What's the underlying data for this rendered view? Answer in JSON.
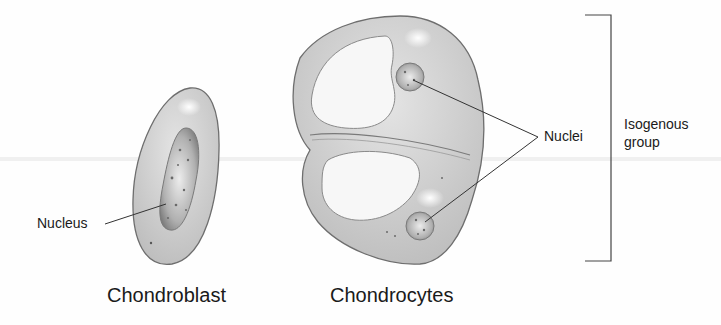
{
  "diagram": {
    "cells": [
      {
        "id": "chondroblast",
        "caption": "Chondroblast",
        "label": "Nucleus"
      },
      {
        "id": "chondrocytes",
        "caption": "Chondrocytes",
        "label": "Nuclei"
      }
    ],
    "bracket_label_line1": "Isogenous",
    "bracket_label_line2": "group",
    "colors": {
      "cytoplasm": "#c9c9c9",
      "cell_outline": "#6e6e6e",
      "lacuna": "#f7f7f7",
      "nucleus": "#9a9a9a",
      "leader_line": "#333333",
      "text": "#1a1a1a"
    }
  }
}
